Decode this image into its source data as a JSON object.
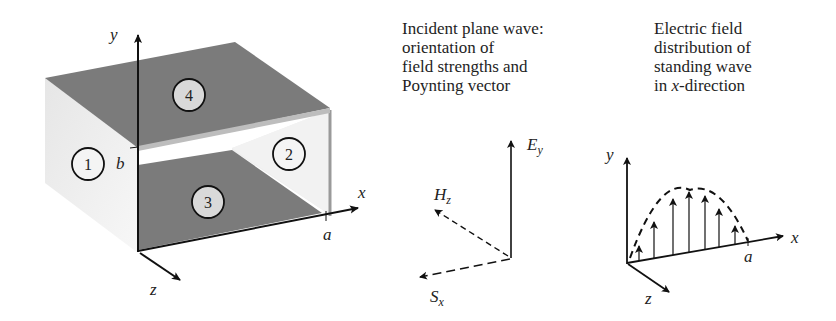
{
  "waveguide": {
    "axis_labels": {
      "y": "y",
      "x": "x",
      "z": "z",
      "a": "a",
      "b": "b"
    },
    "faces": [
      {
        "id": "1",
        "label": "1",
        "role": "left wall"
      },
      {
        "id": "2",
        "label": "2",
        "role": "right wall"
      },
      {
        "id": "3",
        "label": "3",
        "role": "bottom plate"
      },
      {
        "id": "4",
        "label": "4",
        "role": "top plate"
      }
    ],
    "colors": {
      "plate": "#7b7b7b",
      "wall": "#ececec",
      "axis": "#111111"
    }
  },
  "incident_wave": {
    "caption": [
      "Incident plane wave:",
      "orientation of",
      "field strengths and",
      "Poynting vector"
    ],
    "vectors": {
      "E": {
        "symbol": "E",
        "sub": "y"
      },
      "H": {
        "symbol": "H",
        "sub": "z"
      },
      "S": {
        "symbol": "S",
        "sub": "x"
      }
    }
  },
  "standing_wave": {
    "caption_lines": [
      "Electric field",
      "distribution of",
      "standing wave"
    ],
    "caption_last": {
      "prefix": "in ",
      "italic": "x",
      "suffix": "-direction"
    },
    "axis_labels": {
      "y": "y",
      "x": "x",
      "z": "z",
      "a": "a"
    },
    "arrow_count": 7
  }
}
